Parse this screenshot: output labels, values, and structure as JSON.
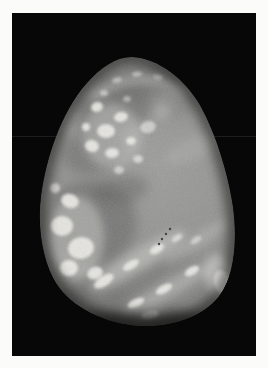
{
  "figure": {
    "label": "Black-and-white photograph of an upright egg-shaped mottled stone against a black background",
    "style": "monochrome halftone print"
  },
  "colors": {
    "page_bg": "#fbfbf9",
    "photo_bg": "#070707",
    "stone_center": "#9d9d9b",
    "stone_mid": "#929290",
    "stone_edge": "#7a7a78",
    "dark_patch": "#606060",
    "light_patch": "#c7c7c3",
    "bright_patch": "#eae9e4",
    "speck": "#3a3a38",
    "rim_shadow": "#030303",
    "scan_line": "#1d1d1d"
  }
}
